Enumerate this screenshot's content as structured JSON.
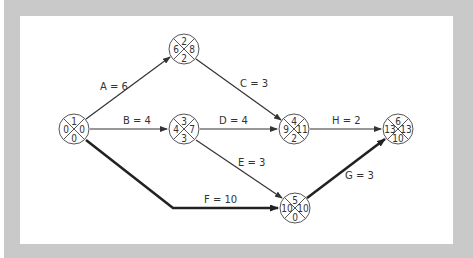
{
  "diagram": {
    "type": "activity-on-arrow network (critical path)",
    "colors": {
      "frame": "#c9c9c9",
      "panel": "#ffffff",
      "line": "#333333",
      "node_stroke": "#555555",
      "critical_line": "#222222"
    },
    "nodes": [
      {
        "id": "1",
        "top": "1",
        "left": "0",
        "right": "0",
        "bottom": "0",
        "cx": 74,
        "cy": 129
      },
      {
        "id": "2",
        "top": "2",
        "left": "6",
        "right": "8",
        "bottom": "2",
        "cx": 184,
        "cy": 49
      },
      {
        "id": "3",
        "top": "3",
        "left": "4",
        "right": "7",
        "bottom": "3",
        "cx": 184,
        "cy": 129
      },
      {
        "id": "4",
        "top": "4",
        "left": "9",
        "right": "11",
        "bottom": "2",
        "cx": 294,
        "cy": 129
      },
      {
        "id": "5",
        "top": "5",
        "left": "10",
        "right": "10",
        "bottom": "0",
        "cx": 295,
        "cy": 208
      },
      {
        "id": "6",
        "top": "6",
        "left": "13",
        "right": "13",
        "bottom": "10",
        "cx": 398,
        "cy": 129
      }
    ],
    "edges": [
      {
        "label": "A = 6",
        "from": "1",
        "to": "2",
        "critical": false
      },
      {
        "label": "B = 4",
        "from": "1",
        "to": "3",
        "critical": false
      },
      {
        "label": "C = 3",
        "from": "2",
        "to": "4",
        "critical": false
      },
      {
        "label": "D = 4",
        "from": "3",
        "to": "4",
        "critical": false
      },
      {
        "label": "E = 3",
        "from": "3",
        "to": "5",
        "critical": false
      },
      {
        "label": "F = 10",
        "from": "1",
        "to": "5",
        "critical": true
      },
      {
        "label": "H = 2",
        "from": "4",
        "to": "6",
        "critical": false
      },
      {
        "label": "G = 3",
        "from": "5",
        "to": "6",
        "critical": true
      }
    ]
  }
}
